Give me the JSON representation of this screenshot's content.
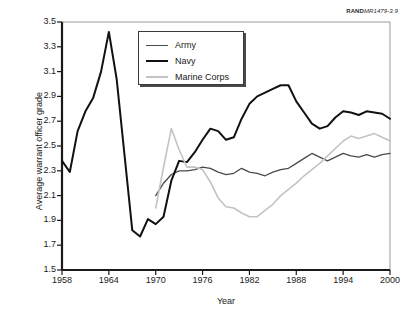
{
  "figure": {
    "source_code_prefix": "RAND",
    "source_code_suffix": "MR1479-3.9"
  },
  "chart_data": {
    "type": "line",
    "title": "",
    "xlabel": "Year",
    "ylabel": "Average warrant officer grade",
    "xlim": [
      1958,
      2000
    ],
    "ylim": [
      1.5,
      3.5
    ],
    "xticks": [
      1958,
      1964,
      1970,
      1976,
      1982,
      1988,
      1994,
      2000
    ],
    "yticks": [
      1.5,
      1.7,
      1.9,
      2.1,
      2.3,
      2.5,
      2.7,
      2.9,
      3.1,
      3.3,
      3.5
    ],
    "grid": false,
    "legend_position": "upper-center-left",
    "series": [
      {
        "name": "Army",
        "color": "#4a4a4a",
        "width": 1.3,
        "x": [
          1970,
          1971,
          1972,
          1973,
          1974,
          1975,
          1976,
          1977,
          1978,
          1979,
          1980,
          1981,
          1982,
          1983,
          1984,
          1985,
          1986,
          1987,
          1988,
          1989,
          1990,
          1991,
          1992,
          1993,
          1994,
          1995,
          1996,
          1997,
          1998,
          1999,
          2000
        ],
        "y": [
          2.1,
          2.2,
          2.27,
          2.3,
          2.3,
          2.31,
          2.33,
          2.32,
          2.29,
          2.27,
          2.28,
          2.32,
          2.29,
          2.28,
          2.26,
          2.29,
          2.31,
          2.32,
          2.36,
          2.4,
          2.44,
          2.41,
          2.38,
          2.41,
          2.44,
          2.42,
          2.41,
          2.43,
          2.41,
          2.43,
          2.44
        ]
      },
      {
        "name": "Navy",
        "color": "#111111",
        "width": 2.0,
        "x": [
          1958,
          1959,
          1960,
          1961,
          1962,
          1963,
          1964,
          1965,
          1966,
          1967,
          1968,
          1969,
          1970,
          1971,
          1972,
          1973,
          1974,
          1975,
          1976,
          1977,
          1978,
          1979,
          1980,
          1981,
          1982,
          1983,
          1984,
          1985,
          1986,
          1987,
          1988,
          1989,
          1990,
          1991,
          1992,
          1993,
          1994,
          1995,
          1996,
          1997,
          1998,
          1999,
          2000
        ],
        "y": [
          2.38,
          2.29,
          2.62,
          2.78,
          2.89,
          3.1,
          3.42,
          3.04,
          2.43,
          1.82,
          1.77,
          1.91,
          1.87,
          1.93,
          2.22,
          2.38,
          2.37,
          2.45,
          2.55,
          2.64,
          2.62,
          2.55,
          2.57,
          2.72,
          2.84,
          2.9,
          2.93,
          2.96,
          2.99,
          2.99,
          2.86,
          2.77,
          2.68,
          2.64,
          2.66,
          2.73,
          2.78,
          2.77,
          2.75,
          2.78,
          2.77,
          2.76,
          2.72
        ]
      },
      {
        "name": "Marine Corps",
        "color": "#c3c3c3",
        "width": 1.6,
        "x": [
          1970,
          1971,
          1972,
          1973,
          1974,
          1975,
          1976,
          1977,
          1978,
          1979,
          1980,
          1981,
          1982,
          1983,
          1984,
          1985,
          1986,
          1987,
          1988,
          1989,
          1990,
          1991,
          1992,
          1993,
          1994,
          1995,
          1996,
          1997,
          1998,
          1999,
          2000
        ],
        "y": [
          2.0,
          2.33,
          2.64,
          2.47,
          2.33,
          2.33,
          2.31,
          2.21,
          2.08,
          2.01,
          2.0,
          1.96,
          1.93,
          1.93,
          1.98,
          2.03,
          2.1,
          2.15,
          2.2,
          2.26,
          2.31,
          2.36,
          2.42,
          2.48,
          2.54,
          2.58,
          2.56,
          2.58,
          2.6,
          2.57,
          2.54
        ]
      }
    ]
  },
  "legend": {
    "items": [
      {
        "label": "Army",
        "color": "#4a4a4a",
        "width": 1.3
      },
      {
        "label": "Navy",
        "color": "#111111",
        "width": 2.0
      },
      {
        "label": "Marine Corps",
        "color": "#c3c3c3",
        "width": 1.6
      }
    ]
  }
}
